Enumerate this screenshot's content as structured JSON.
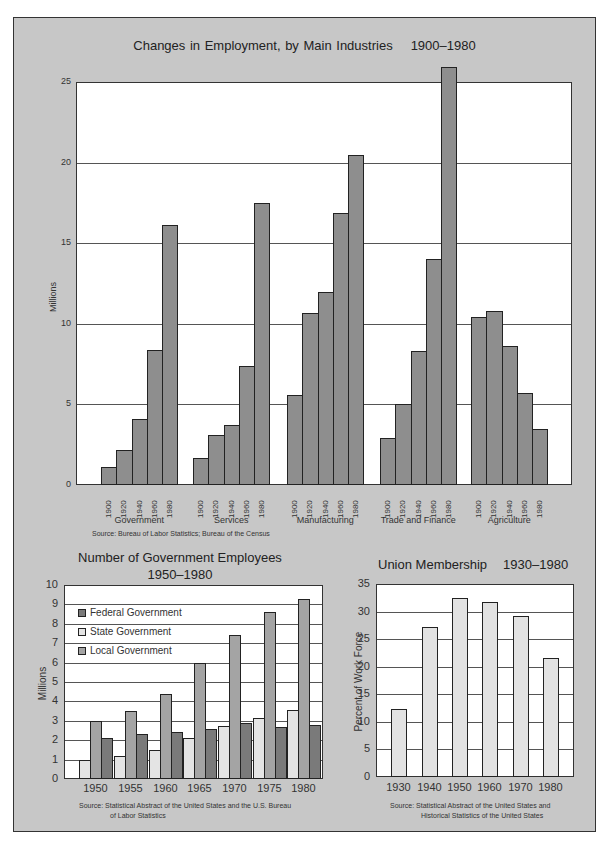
{
  "colors": {
    "panel_bg": "#c7c7c7",
    "plot_bg": "#ffffff",
    "bar_main": "#8e8e8e",
    "federal": "#7a7a7a",
    "state": "#e4e4e4",
    "local": "#a4a4a4",
    "union": "#e2e2e2"
  },
  "main_chart": {
    "title": "Changes in Employment, by Main Industries",
    "title_years": "1900–1980",
    "ylabel": "Millions",
    "yticks": [
      "0",
      "5",
      "10",
      "15",
      "20",
      "25"
    ],
    "source": "Source: Bureau of Labor Statistics; Bureau of the Census"
  },
  "gov_chart": {
    "title_line1": "Number of Government Employees",
    "title_line2": "1950–1980",
    "ylabel": "Millions",
    "yticks": [
      "0",
      "1",
      "2",
      "3",
      "4",
      "5",
      "6",
      "7",
      "8",
      "9",
      "10"
    ],
    "legend": [
      "Federal Government",
      "State Government",
      "Local Government"
    ],
    "source_line1": "Source:  Statistical Abstract of the United States and the U.S. Bureau",
    "source_line2": "of Labor Statistics"
  },
  "union_chart": {
    "title": "Union Membership",
    "title_years": "1930–1980",
    "ylabel": "Percent of Work Force",
    "yticks": [
      "0",
      "5",
      "10",
      "15",
      "20",
      "25",
      "30",
      "35"
    ],
    "source_line1": "Source:  Statistical Abstract of the United States and",
    "source_line2": "Historical Statistics of the United States"
  },
  "chart_data": [
    {
      "type": "bar",
      "title": "Changes in Employment, by Main Industries 1900–1980",
      "xlabel": "",
      "ylabel": "Millions",
      "ylim": [
        0,
        25
      ],
      "grid": true,
      "x": [
        "1900",
        "1920",
        "1940",
        "1960",
        "1980"
      ],
      "categories": [
        "Government",
        "Services",
        "Manufacturing",
        "Trade and Finance",
        "Agriculture"
      ],
      "series": [
        {
          "name": "Government",
          "values": [
            1.1,
            2.2,
            4.1,
            8.4,
            16.1
          ]
        },
        {
          "name": "Services",
          "values": [
            1.7,
            3.1,
            3.7,
            7.4,
            17.5
          ]
        },
        {
          "name": "Manufacturing",
          "values": [
            5.6,
            10.7,
            12.0,
            16.9,
            20.5
          ]
        },
        {
          "name": "Trade and Finance",
          "values": [
            2.9,
            5.0,
            8.3,
            14.0,
            25.9
          ]
        },
        {
          "name": "Agriculture",
          "values": [
            10.4,
            10.8,
            8.6,
            5.7,
            3.5
          ]
        }
      ],
      "source": "Source: Bureau of Labor Statistics; Bureau of the Census"
    },
    {
      "type": "bar",
      "title": "Number of Government Employees 1950–1980",
      "xlabel": "",
      "ylabel": "Millions",
      "ylim": [
        0,
        10
      ],
      "grid": true,
      "legend_position": "upper-left",
      "categories": [
        "1950",
        "1955",
        "1960",
        "1965",
        "1970",
        "1975",
        "1980"
      ],
      "series": [
        {
          "name": "State Government",
          "values": [
            1.0,
            1.2,
            1.5,
            2.1,
            2.75,
            3.15,
            3.55
          ]
        },
        {
          "name": "Local Government",
          "values": [
            3.0,
            3.5,
            4.4,
            6.0,
            7.4,
            8.6,
            9.3
          ]
        },
        {
          "name": "Federal Government",
          "values": [
            2.1,
            2.3,
            2.4,
            2.6,
            2.9,
            2.7,
            2.8
          ]
        }
      ],
      "source": "Source: Statistical Abstract of the United States and the U.S. Bureau of Labor Statistics"
    },
    {
      "type": "bar",
      "title": "Union Membership 1930–1980",
      "xlabel": "",
      "ylabel": "Percent of Work Force",
      "ylim": [
        0,
        35
      ],
      "grid": true,
      "categories": [
        "1930",
        "1940",
        "1950",
        "1960",
        "1970",
        "1980"
      ],
      "values": [
        12.3,
        27.2,
        32.5,
        31.7,
        29.2,
        21.5
      ],
      "source": "Source: Statistical Abstract of the United States and Historical Statistics of the United States"
    }
  ]
}
